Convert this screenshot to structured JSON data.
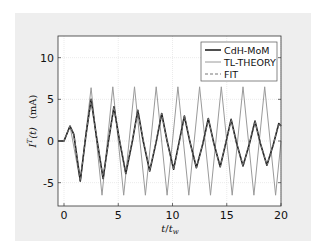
{
  "chart_data": {
    "type": "line",
    "title": "",
    "xlabel": "t/t_w",
    "ylabel": "I^T(t)  (mA)",
    "xlim": [
      0,
      20
    ],
    "ylim": [
      -8,
      13
    ],
    "xticks": [
      0,
      5,
      10,
      15,
      20
    ],
    "yticks": [
      -5,
      0,
      5,
      10
    ],
    "xtick_labels": [
      "0",
      "5",
      "10",
      "15",
      "20"
    ],
    "ytick_labels": [
      "-5",
      "0",
      "5",
      "10"
    ],
    "grid": true,
    "legend_position": "upper right",
    "series": [
      {
        "name": "CdH-MoM",
        "style": "solid",
        "color": "#222222",
        "width": 1.6,
        "x": [
          -0.6,
          0,
          0.55,
          0.9,
          1.5,
          2.0,
          2.5,
          3.0,
          3.6,
          4.1,
          4.6,
          5.1,
          5.7,
          6.3,
          6.8,
          7.3,
          7.9,
          8.5,
          9.0,
          9.5,
          10.1,
          10.6,
          11.1,
          11.6,
          12.2,
          12.8,
          13.3,
          13.8,
          14.4,
          14.9,
          15.4,
          15.9,
          16.5,
          17.1,
          17.6,
          18.1,
          18.7,
          19.3,
          19.8,
          20.0
        ],
        "y": [
          0,
          0,
          1.8,
          0.8,
          -4.8,
          0.5,
          5.0,
          0.5,
          -4.5,
          0.0,
          4.1,
          0.2,
          -3.9,
          0.0,
          3.7,
          0.0,
          -3.6,
          -0.1,
          3.3,
          0.0,
          -3.4,
          -0.2,
          3.0,
          -0.1,
          -3.2,
          -0.3,
          2.7,
          -0.2,
          -3.1,
          -0.3,
          2.6,
          -0.2,
          -3.0,
          -0.3,
          2.4,
          -0.3,
          -2.9,
          -0.4,
          2.1,
          1.8
        ]
      },
      {
        "name": "TL-THEORY",
        "style": "solid",
        "color": "#9a9a9a",
        "width": 1.0,
        "x": [
          -0.6,
          0,
          0.55,
          1.5,
          2.5,
          3.5,
          4.5,
          5.5,
          6.5,
          7.5,
          8.5,
          9.5,
          10.5,
          11.5,
          12.5,
          13.5,
          14.5,
          15.5,
          16.5,
          17.5,
          18.5,
          19.5,
          20.0
        ],
        "y": [
          0,
          0,
          1.8,
          -4.9,
          6.4,
          -6.5,
          6.5,
          -6.5,
          6.5,
          -6.5,
          6.5,
          -6.5,
          6.5,
          -6.5,
          6.5,
          -6.5,
          6.5,
          -6.5,
          6.5,
          -6.5,
          6.5,
          -6.5,
          0
        ]
      },
      {
        "name": "FIT",
        "style": "dashed",
        "color": "#777777",
        "width": 1.0,
        "x": [
          -0.6,
          0,
          0.55,
          0.9,
          1.5,
          2.0,
          2.5,
          3.0,
          3.6,
          4.1,
          4.6,
          5.1,
          5.7,
          6.3,
          6.8,
          7.3,
          7.9,
          8.5,
          9.0,
          9.5,
          10.1,
          10.6,
          11.1,
          11.6,
          12.2,
          12.8,
          13.3,
          13.8,
          14.4,
          14.9,
          15.4,
          15.9,
          16.5,
          17.1,
          17.6,
          18.1,
          18.7,
          19.3,
          19.8,
          20.0
        ],
        "y": [
          0,
          0,
          1.8,
          0.8,
          -4.8,
          0.5,
          5.0,
          0.5,
          -4.5,
          0.0,
          4.1,
          0.2,
          -3.9,
          0.0,
          3.7,
          0.0,
          -3.6,
          -0.1,
          3.3,
          0.0,
          -3.4,
          -0.2,
          3.0,
          -0.1,
          -3.2,
          -0.3,
          2.7,
          -0.2,
          -3.1,
          -0.3,
          2.6,
          -0.2,
          -3.0,
          -0.3,
          2.4,
          -0.3,
          -2.9,
          -0.4,
          2.1,
          1.8
        ]
      }
    ]
  },
  "axes": {
    "xlabel_t": "t",
    "xlabel_slash": "/",
    "xlabel_tw": "t",
    "xlabel_tw_sub": "w",
    "ylabel_I": "I",
    "ylabel_sup": "T",
    "ylabel_t": "(t)",
    "ylabel_unit": "(mA)"
  },
  "legend": {
    "items": [
      {
        "label": "CdH-MoM"
      },
      {
        "label": "TL-THEORY"
      },
      {
        "label": "FIT"
      }
    ]
  }
}
